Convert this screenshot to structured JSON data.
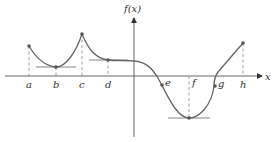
{
  "figure": {
    "y_axis_label": "f(x)",
    "x_axis_label": "x",
    "points": [
      {
        "label": "a",
        "x": 29,
        "y": 46
      },
      {
        "label": "b",
        "x": 56,
        "y": 67
      },
      {
        "label": "c",
        "x": 82,
        "y": 34
      },
      {
        "label": "d",
        "x": 108,
        "y": 60
      },
      {
        "label": "e",
        "x": 162,
        "y": 85
      },
      {
        "label": "f",
        "x": 189,
        "y": 118
      },
      {
        "label": "g",
        "x": 216,
        "y": 86
      },
      {
        "label": "h",
        "x": 243,
        "y": 43
      }
    ],
    "colors": {
      "curve": "#666666",
      "axis": "#555555",
      "dashed": "#888888",
      "background": "#ffffff"
    }
  }
}
